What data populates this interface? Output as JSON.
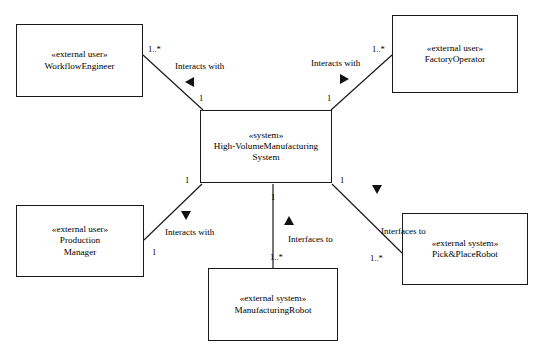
{
  "diagram": {
    "type": "uml-context-diagram",
    "background_color": "#ffffff",
    "line_color": "#1a1a1a",
    "text_color": "#000000",
    "nodes": [
      {
        "id": "workflow-engineer",
        "stereotype": "«external user»",
        "name": "WorkflowEngineer",
        "lines": [
          "«external user»",
          "WorkflowEngineer"
        ],
        "x": 16,
        "y": 24,
        "w": 127,
        "h": 73
      },
      {
        "id": "factory-operator",
        "stereotype": "«external user»",
        "name": "FactoryOperator",
        "lines": [
          "«external user»",
          "FactoryOperator"
        ],
        "x": 392,
        "y": 15,
        "w": 126,
        "h": 78
      },
      {
        "id": "high-volume-manufacturing-system",
        "stereotype": "«system»",
        "name": "High-VolumeManufacturingSystem",
        "lines": [
          "«system»",
          "High-VolumeManufacturing",
          "System"
        ],
        "x": 200,
        "y": 110,
        "w": 132,
        "h": 73
      },
      {
        "id": "production-manager",
        "stereotype": "«external user»",
        "name": "ProductionManager",
        "lines": [
          "«external user»",
          "Production",
          "Manager"
        ],
        "x": 16,
        "y": 205,
        "w": 128,
        "h": 72
      },
      {
        "id": "manufacturing-robot",
        "stereotype": "«external system»",
        "name": "ManufacturingRobot",
        "lines": [
          "«external system»",
          "ManufacturingRobot"
        ],
        "x": 208,
        "y": 268,
        "w": 130,
        "h": 73
      },
      {
        "id": "pick-and-place-robot",
        "stereotype": "«external system»",
        "name": "Pick&PlaceRobot",
        "lines": [
          "«external system»",
          "Pick&PlaceRobot"
        ],
        "x": 402,
        "y": 213,
        "w": 126,
        "h": 72
      },
      {
        "id": "interfaces-to-left-fragment",
        "lines": [
          "to"
        ],
        "x": 0,
        "y": 0,
        "w": 0,
        "h": 0
      }
    ],
    "edges": [
      {
        "id": "workflow-engineer-to-system",
        "label": "Interacts with",
        "label_x": 175,
        "label_y": 62,
        "source": "workflow-engineer",
        "target": "high-volume-manufacturing-system",
        "source_multiplicity": "1..*",
        "source_mult_x": 148,
        "source_mult_y": 45,
        "target_multiplicity": "1",
        "target_mult_x": 199,
        "target_mult_y": 94,
        "x1": 143,
        "y1": 55,
        "x2": 203,
        "y2": 110,
        "arrow_direction": "left",
        "arrow_x": 185,
        "arrow_y": 77
      },
      {
        "id": "factory-operator-to-system",
        "label": "Interacts with",
        "label_x": 311,
        "label_y": 59,
        "source": "factory-operator",
        "target": "high-volume-manufacturing-system",
        "source_multiplicity": "1..*",
        "source_mult_x": 372,
        "source_mult_y": 45,
        "target_multiplicity": "1",
        "target_mult_x": 327,
        "target_mult_y": 94,
        "x1": 392,
        "y1": 55,
        "x2": 331,
        "y2": 110,
        "arrow_direction": "right",
        "arrow_x": 340,
        "arrow_y": 74
      },
      {
        "id": "production-manager-to-system",
        "label": "Interacts with",
        "label_x": 165,
        "label_y": 228,
        "source": "production-manager",
        "target": "high-volume-manufacturing-system",
        "source_multiplicity": "1",
        "source_mult_x": 152,
        "source_mult_y": 248,
        "target_multiplicity": "1",
        "target_mult_x": 185,
        "target_mult_y": 176,
        "x1": 144,
        "y1": 240,
        "x2": 202,
        "y2": 184,
        "arrow_direction": "down",
        "arrow_x": 181,
        "arrow_y": 211
      },
      {
        "id": "system-to-manufacturing-robot",
        "label": "Interfaces to",
        "label_x": 288,
        "label_y": 235,
        "source": "high-volume-manufacturing-system",
        "target": "manufacturing-robot",
        "source_multiplicity": "1",
        "source_mult_x": 271,
        "source_mult_y": 193,
        "target_multiplicity": "1..*",
        "target_mult_x": 270,
        "target_mult_y": 253,
        "x1": 273,
        "y1": 184,
        "x2": 273,
        "y2": 268,
        "arrow_direction": "up",
        "arrow_x": 284,
        "arrow_y": 216
      },
      {
        "id": "system-to-pick-and-place-robot",
        "label": "Interfaces to",
        "label_x": 381,
        "label_y": 227,
        "source": "high-volume-manufacturing-system",
        "target": "pick-and-place-robot",
        "source_multiplicity": "1",
        "source_mult_x": 340,
        "source_mult_y": 176,
        "target_multiplicity": "1..*",
        "target_mult_x": 370,
        "target_mult_y": 254,
        "x1": 332,
        "y1": 184,
        "x2": 402,
        "y2": 253,
        "arrow_direction": "down",
        "arrow_x": 372,
        "arrow_y": 185
      }
    ]
  }
}
